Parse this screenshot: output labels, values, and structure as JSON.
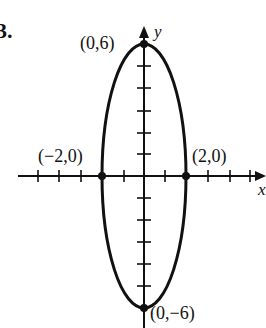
{
  "problem": {
    "number": "3."
  },
  "axes": {
    "x_label": "x",
    "y_label": "y"
  },
  "points": [
    {
      "label": "(0,6)",
      "x": 0,
      "y": 6
    },
    {
      "label": "(−2,0)",
      "x": -2,
      "y": 0
    },
    {
      "label": "(2,0)",
      "x": 2,
      "y": 0
    },
    {
      "label": "(0,−6)",
      "x": 0,
      "y": -6
    }
  ],
  "curve": {
    "type": "ellipse",
    "semi_axis_x": 2,
    "semi_axis_y": 6,
    "center": [
      0,
      0
    ]
  },
  "ticks": {
    "x": [
      -6,
      -5,
      -4,
      -3,
      -2,
      -1,
      1,
      2,
      3,
      4,
      5
    ],
    "y": [
      -6,
      -5,
      -4,
      -3,
      -2,
      -1,
      1,
      2,
      3,
      4,
      5,
      6
    ]
  },
  "colors": {
    "ink": "#111111",
    "background": "#ffffff"
  }
}
